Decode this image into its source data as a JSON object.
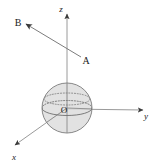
{
  "figure": {
    "type": "3d-vector-sphere-diagram",
    "width": 161,
    "height": 166,
    "background_color": "#ffffff",
    "line_color": "#8c8c8c",
    "sphere_fill_color": "#dcdcdc",
    "sphere_stroke_color": "#808080",
    "label_color": "#1a1a1a",
    "cropped_top_text": "· · · · · · · ·"
  },
  "axes": {
    "z": {
      "label": "z",
      "direction": "up",
      "origin": {
        "x": 67,
        "y": 108
      },
      "tip": {
        "x": 67,
        "y": 12
      },
      "label_pos": {
        "x": 62,
        "y": 11
      }
    },
    "y": {
      "label": "y",
      "direction": "right",
      "origin": {
        "x": 67,
        "y": 108
      },
      "tip": {
        "x": 147,
        "y": 110
      },
      "label_pos": {
        "x": 145,
        "y": 118
      }
    },
    "x": {
      "label": "x",
      "direction": "lower-left",
      "origin": {
        "x": 67,
        "y": 108
      },
      "tip": {
        "x": 12,
        "y": 147
      },
      "label_pos": {
        "x": 13,
        "y": 159
      }
    }
  },
  "sphere": {
    "center": {
      "x": 67,
      "y": 108
    },
    "radius": 25,
    "equator_rx": 25,
    "equator_ry": 7.5,
    "equator_front_style": "solid",
    "equator_back_style": "dotted",
    "upper_latitude_style": "dotted"
  },
  "points": [
    {
      "name": "O",
      "label": "O",
      "x": 61,
      "y": 112,
      "role": "origin"
    },
    {
      "name": "A",
      "label": "A",
      "x": 83,
      "y": 64,
      "role": "vector-tail"
    },
    {
      "name": "B",
      "label": "B",
      "x": 14,
      "y": 26,
      "role": "vector-head"
    }
  ],
  "vector": {
    "name": "AB",
    "from_label": "A",
    "to_label": "B",
    "start": {
      "x": 81,
      "y": 57
    },
    "end": {
      "x": 24,
      "y": 23
    },
    "arrowhead_at": "B"
  }
}
